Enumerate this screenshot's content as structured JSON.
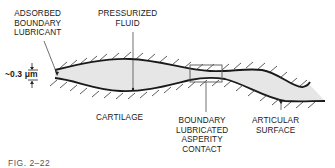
{
  "figure": {
    "caption": "FIG. 2–22"
  },
  "labels": {
    "adsorbed": [
      "ADSORBED",
      "BOUNDARY",
      "LUBRICANT"
    ],
    "pressurized": [
      "PRESSURIZED",
      "FLUID"
    ],
    "cartilage": "CARTILAGE",
    "boundary_contact": [
      "BOUNDARY",
      "LUBRICATED",
      "ASPERITY",
      "CONTACT"
    ],
    "articular": [
      "ARTICULAR",
      "SURFACE"
    ],
    "thickness": "~0.3 μm"
  },
  "colors": {
    "line": "#1a1a1a",
    "fluid": "#e4e4e4",
    "box": "#555555"
  }
}
